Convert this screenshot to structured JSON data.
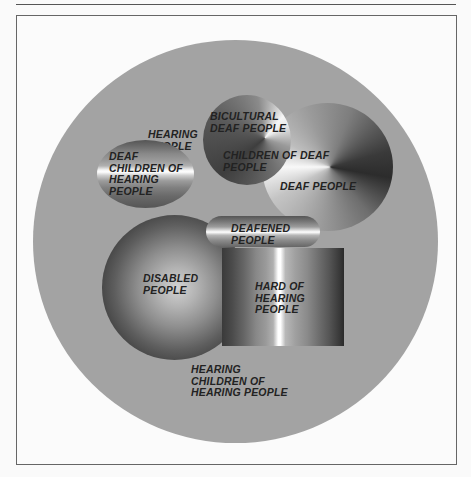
{
  "page": {
    "header_text": "",
    "figure_frame": true
  },
  "diagram": {
    "type": "nested-region-diagram",
    "title": "",
    "outer_region": {
      "label": [
        "HEARING",
        "PEOPLE"
      ],
      "shape": "circle",
      "fill": "#a3a3a3"
    },
    "regions": [
      {
        "id": "deaf-children-of-hearing-people",
        "label": [
          "DEAF",
          "CHILDREN OF",
          "HEARING",
          "PEOPLE"
        ],
        "shape": "ellipse",
        "gradient": "horizontal-bands"
      },
      {
        "id": "bicultural-deaf-people",
        "label": [
          "BICULTURAL",
          "DEAF PEOPLE"
        ],
        "shape": "circle",
        "gradient": "conic"
      },
      {
        "id": "children-of-deaf-people",
        "label": [
          "CHILDREN OF DEAF",
          "PEOPLE"
        ],
        "shape": "overlap-zone"
      },
      {
        "id": "deaf-people",
        "label": [
          "DEAF PEOPLE"
        ],
        "shape": "circle",
        "gradient": "conic"
      },
      {
        "id": "deafened-people",
        "label": [
          "DEAFENED",
          "PEOPLE"
        ],
        "shape": "pill",
        "gradient": "horizontal-bands"
      },
      {
        "id": "disabled-people",
        "label": [
          "DISABLED",
          "PEOPLE"
        ],
        "shape": "circle",
        "gradient": "radial"
      },
      {
        "id": "hard-of-hearing-people",
        "label": [
          "HARD OF",
          "HEARING",
          "PEOPLE"
        ],
        "shape": "rectangle",
        "gradient": "vertical-bands"
      },
      {
        "id": "hearing-children-of-hearing-people",
        "label": [
          "HEARING",
          "CHILDREN OF",
          "HEARING PEOPLE"
        ],
        "shape": "text-only"
      }
    ]
  },
  "labels": {
    "hearing_people": "HEARING\nPEOPLE",
    "deaf_children": "DEAF\nCHILDREN OF\nHEARING\nPEOPLE",
    "bicultural": "BICULTURAL\nDEAF PEOPLE",
    "children_of_deaf": "CHILDREN OF DEAF\nPEOPLE",
    "deaf_people": "DEAF PEOPLE",
    "deafened": "DEAFENED\nPEOPLE",
    "disabled": "DISABLED\nPEOPLE",
    "hard_of_hearing": "HARD OF\nHEARING\nPEOPLE",
    "hearing_children": "HEARING\nCHILDREN OF\nHEARING PEOPLE"
  }
}
